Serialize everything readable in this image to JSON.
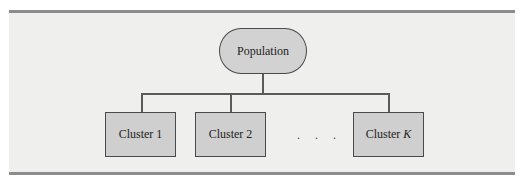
{
  "diagram": {
    "root": {
      "label": "Population",
      "shape": "rounded-terminator"
    },
    "children": [
      {
        "label": "Cluster 1"
      },
      {
        "label": "Cluster 2"
      },
      {
        "label": "Cluster ",
        "label_italic_suffix": "K"
      }
    ],
    "ellipsis": ". . .",
    "colors": {
      "panel": "#efefee",
      "node_fill": "#cfcfcf",
      "border": "#4a4a4a",
      "rule": "#8c8c8c"
    }
  }
}
